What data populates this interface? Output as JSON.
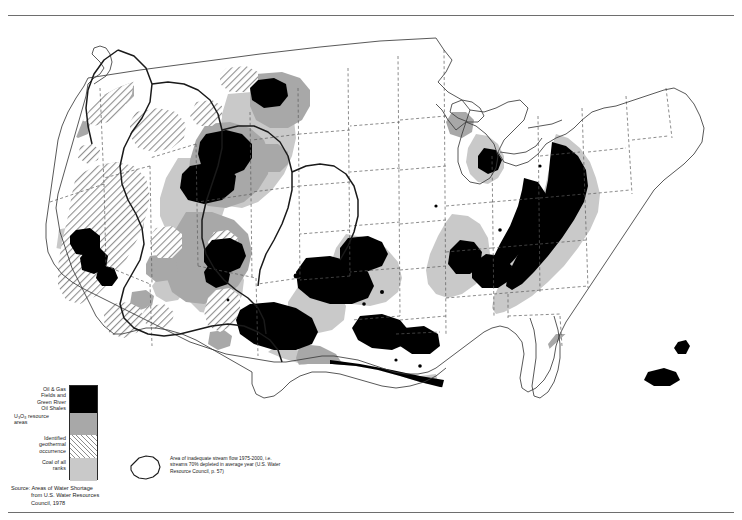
{
  "page": {
    "kind": "thematic-map",
    "region": "Conterminous United States",
    "background": "#ffffff"
  },
  "legend": {
    "title": "",
    "items": [
      {
        "id": "oil-gas",
        "swatch": "solid-black",
        "color": "#000000",
        "lines": [
          "Oil & Gas",
          "Fields and",
          "Green River",
          "Oil Shales"
        ]
      },
      {
        "id": "uranium",
        "swatch": "solid-gray",
        "color": "#a8a8a8",
        "lines": [
          "U₃O₈ resource",
          "areas"
        ]
      },
      {
        "id": "geothermal",
        "swatch": "diagonal-hatch",
        "color": "#8c8c8c",
        "lines": [
          "Identified",
          "geothermal",
          "occurrence"
        ]
      },
      {
        "id": "coal",
        "swatch": "solid-light-gray",
        "color": "#c9c9c9",
        "lines": [
          "Coal of all",
          "ranks"
        ]
      }
    ]
  },
  "shortage_key": {
    "icon": "water-shortage-outline",
    "lines": [
      "Area of inadequate stream flow 1975-2000, i.e.",
      "streams 70% depleted in average year (U.S. Water",
      "Resource Council, p. 57)"
    ]
  },
  "source": {
    "lines": [
      "Source: Areas of Water Shortage",
      "from U.S. Water Resources",
      "Council, 1978"
    ]
  },
  "map_style": {
    "coast_stroke": "#3b3b3b",
    "state_stroke": "#555555",
    "shortage_stroke": "#1a1a1a",
    "oil_fill": "#000000",
    "uranium_fill": "#a8a8a8",
    "coal_fill": "#c9c9c9",
    "geothermal_fill": "#8c8c8c"
  }
}
